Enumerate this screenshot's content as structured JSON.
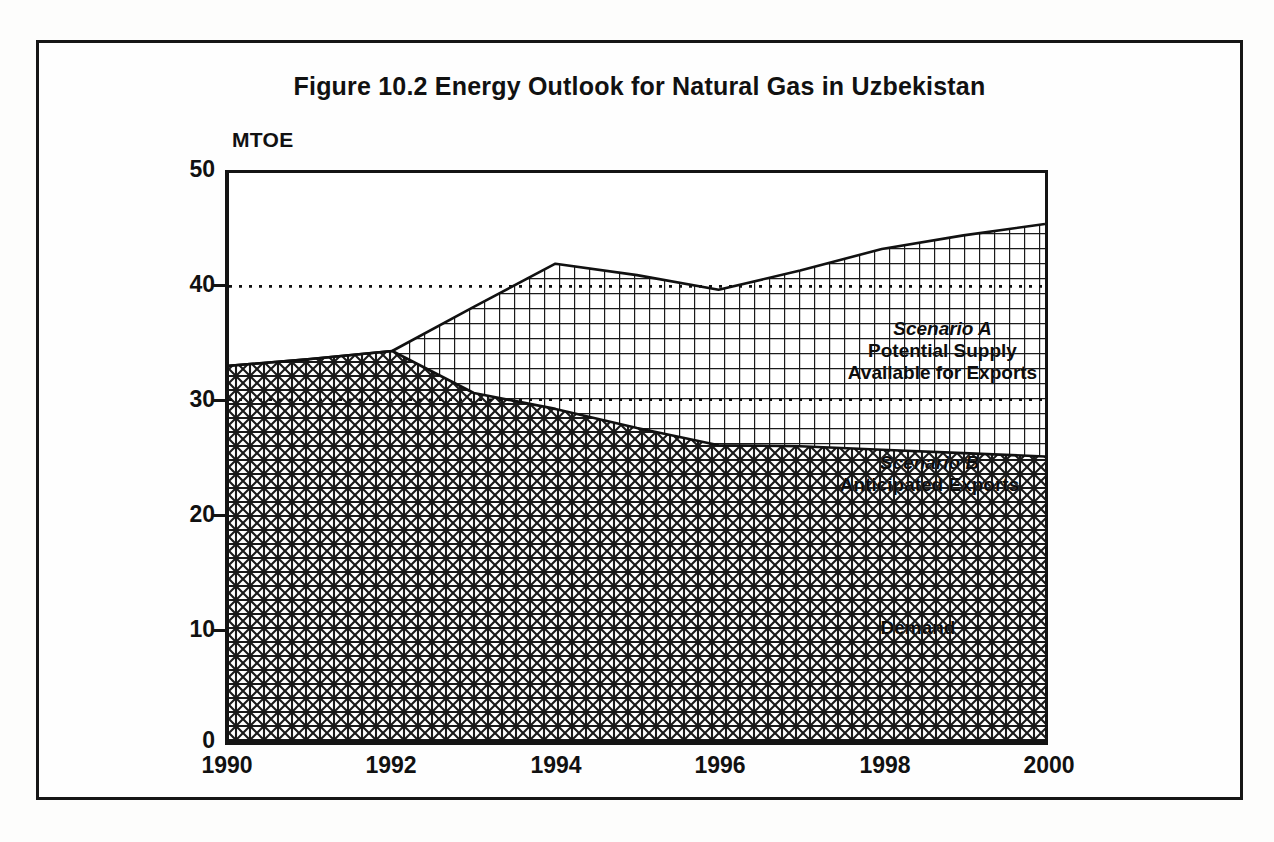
{
  "figure": {
    "title": "Figure 10.2  Energy Outlook for Natural Gas in Uzbekistan",
    "y_axis_title": "MTOE"
  },
  "axes": {
    "y_ticks": [
      "50",
      "40",
      "30",
      "20",
      "10",
      "0"
    ],
    "x_ticks": [
      "1990",
      "1992",
      "1994",
      "1996",
      "1998",
      "2000"
    ]
  },
  "annotations": {
    "scenario_a": {
      "line1": "Scenario A",
      "line2": "Potential Supply",
      "line3": "Available for Exports"
    },
    "scenario_b": {
      "line1": "Scenario B",
      "line2": "Anticipated Exports"
    },
    "demand": {
      "line1": "Demand"
    }
  },
  "colors": {
    "ink": "#141414",
    "paper": "#ffffff",
    "hatch": "#1a1a1a"
  },
  "chart_data": {
    "type": "area",
    "title": "Figure 10.2  Energy Outlook for Natural Gas in Uzbekistan",
    "xlabel": "",
    "ylabel": "MTOE",
    "xlim": [
      1990,
      2000
    ],
    "ylim": [
      0,
      50
    ],
    "grid": "dotted horizontal gridlines at 30 and 40",
    "legend": "in-plot band annotations",
    "x": [
      1990,
      1991,
      1992,
      1993,
      1994,
      1995,
      1996,
      1997,
      1998,
      1999,
      2000
    ],
    "series": [
      {
        "name": "Demand",
        "note": "lower band, filled from 0 up to the demand curve",
        "values": [
          33.0,
          33.6,
          34.3,
          30.6,
          29.2,
          27.5,
          26.0,
          25.9,
          25.6,
          25.3,
          25.0
        ]
      },
      {
        "name": "Scenario B Anticipated Exports",
        "note": "middle band upper boundary coincides with total supply only after 1992; band lies between demand curve and total supply curve in Scenario B region",
        "values": [
          33.0,
          33.6,
          34.3,
          30.6,
          29.2,
          27.5,
          26.0,
          25.9,
          25.6,
          25.3,
          25.0
        ]
      },
      {
        "name": "Scenario A Potential Supply Available for Exports",
        "note": "upper boundary = total potential supply",
        "values": [
          33.0,
          33.6,
          34.3,
          38.2,
          42.0,
          41.0,
          39.7,
          41.4,
          43.3,
          44.5,
          45.5
        ]
      }
    ],
    "gridline_values": [
      30,
      40
    ]
  }
}
